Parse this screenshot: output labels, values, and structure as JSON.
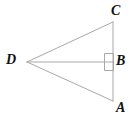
{
  "figure": {
    "background_color": "#ffffff",
    "line_color": "#a8a8a8",
    "line_width": 1,
    "label_color": "#111111",
    "canvas": {
      "width": 140,
      "height": 119
    },
    "vertices": [
      {
        "id": "C",
        "label": "C",
        "x": 113,
        "y": 22
      },
      {
        "id": "B",
        "label": "B",
        "x": 113,
        "y": 62
      },
      {
        "id": "A",
        "label": "A",
        "x": 113,
        "y": 101
      },
      {
        "id": "D",
        "label": "D",
        "x": 27,
        "y": 62
      }
    ],
    "segments": [
      {
        "id": "DC",
        "from": "D",
        "to": "C"
      },
      {
        "id": "CA",
        "from": "C",
        "to": "A"
      },
      {
        "id": "AD",
        "from": "A",
        "to": "D"
      },
      {
        "id": "DB",
        "from": "D",
        "to": "B"
      }
    ],
    "right_angle_marker": {
      "at_vertex": "B",
      "x": 105,
      "y": 54,
      "size": 9,
      "opens_toward": "upper-left"
    },
    "labels": {
      "C": "C",
      "B": "B",
      "A": "A",
      "D": "D"
    }
  }
}
